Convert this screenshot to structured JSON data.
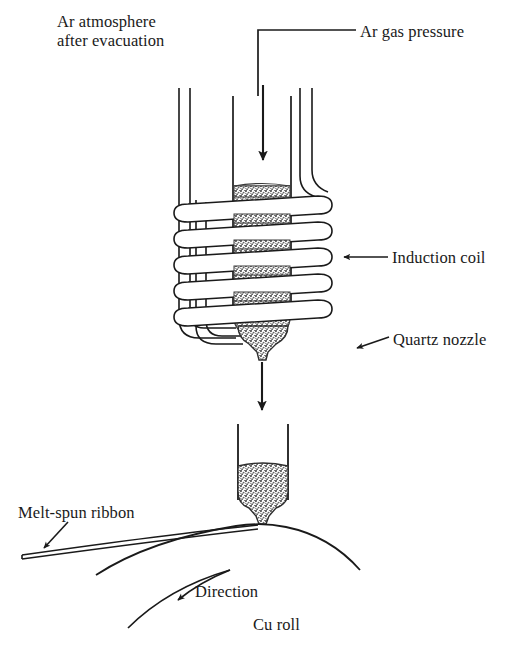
{
  "figure": {
    "type": "schematic-diagram",
    "labels": {
      "ar_atmosphere": "Ar atmosphere\nafter evacuation",
      "ar_gas_pressure": "Ar gas pressure",
      "induction_coil": "Induction coil",
      "quartz_nozzle": "Quartz nozzle",
      "melt_spun_ribbon": "Melt-spun ribbon",
      "direction": "Direction",
      "cu_roll": "Cu roll"
    },
    "colors": {
      "ink": "#1a1a1a",
      "background": "#ffffff",
      "melt_fill": "#8d8d8d"
    },
    "parts": {
      "coil_turns": 5,
      "melt_material": "molten alloy",
      "chamber": "evacuated chamber backfilled with Ar"
    }
  }
}
